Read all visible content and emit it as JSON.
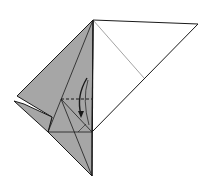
{
  "diagram": {
    "type": "origami-step",
    "colors": {
      "paper_front": "#ffffff",
      "paper_back": "#a6a6a6",
      "line": "#1a1a1a",
      "crease": "#8c8c8c"
    },
    "symbols": [
      {
        "name": "valley-fold-line",
        "style": "dashed"
      },
      {
        "name": "fold-direction-arrow",
        "style": "curved"
      }
    ]
  }
}
